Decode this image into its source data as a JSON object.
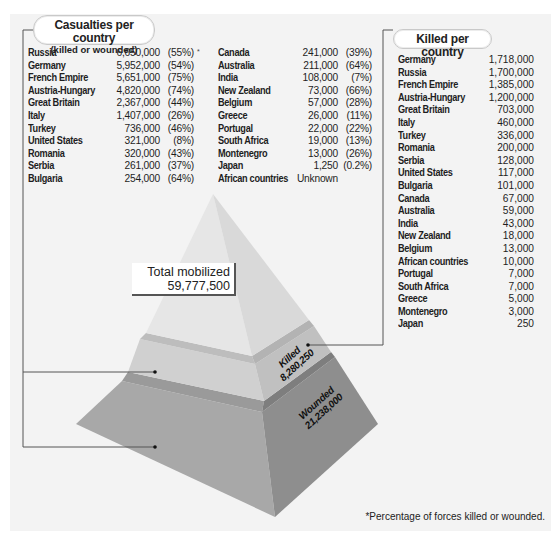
{
  "casualties": {
    "title": "Casualties per country",
    "subtitle": "(killed or wounded)",
    "asterisk": "*",
    "col1": [
      {
        "country": "Russia",
        "count": "6,650,000",
        "pct": "(55%)"
      },
      {
        "country": "Germany",
        "count": "5,952,000",
        "pct": "(54%)"
      },
      {
        "country": "French Empire",
        "count": "5,651,000",
        "pct": "(75%)"
      },
      {
        "country": "Austria-Hungary",
        "count": "4,820,000",
        "pct": "(74%)"
      },
      {
        "country": "Great Britain",
        "count": "2,367,000",
        "pct": "(44%)"
      },
      {
        "country": "Italy",
        "count": "1,407,000",
        "pct": "(26%)"
      },
      {
        "country": "Turkey",
        "count": "736,000",
        "pct": "(46%)"
      },
      {
        "country": "United States",
        "count": "321,000",
        "pct": "(8%)"
      },
      {
        "country": "Romania",
        "count": "320,000",
        "pct": "(43%)"
      },
      {
        "country": "Serbia",
        "count": "261,000",
        "pct": "(37%)"
      },
      {
        "country": "Bulgaria",
        "count": "254,000",
        "pct": "(64%)"
      }
    ],
    "col2": [
      {
        "country": "Canada",
        "count": "241,000",
        "pct": "(39%)"
      },
      {
        "country": "Australia",
        "count": "211,000",
        "pct": "(64%)"
      },
      {
        "country": "India",
        "count": "108,000",
        "pct": "(7%)"
      },
      {
        "country": "New Zealand",
        "count": "73,000",
        "pct": "(66%)"
      },
      {
        "country": "Belgium",
        "count": "57,000",
        "pct": "(28%)"
      },
      {
        "country": "Greece",
        "count": "26,000",
        "pct": "(11%)"
      },
      {
        "country": "Portugal",
        "count": "22,000",
        "pct": "(22%)"
      },
      {
        "country": "South Africa",
        "count": "19,000",
        "pct": "(13%)"
      },
      {
        "country": "Montenegro",
        "count": "13,000",
        "pct": "(26%)"
      },
      {
        "country": "Japan",
        "count": "1,250",
        "pct": "(0.2%)"
      },
      {
        "country": "African countries",
        "count": "Unknown",
        "pct": ""
      }
    ]
  },
  "killed": {
    "title": "Killed per country",
    "rows": [
      {
        "country": "Germany",
        "count": "1,718,000"
      },
      {
        "country": "Russia",
        "count": "1,700,000"
      },
      {
        "country": "French Empire",
        "count": "1,385,000"
      },
      {
        "country": "Austria-Hungary",
        "count": "1,200,000"
      },
      {
        "country": "Great Britain",
        "count": "703,000"
      },
      {
        "country": "Italy",
        "count": "460,000"
      },
      {
        "country": "Turkey",
        "count": "336,000"
      },
      {
        "country": "Romania",
        "count": "200,000"
      },
      {
        "country": "Serbia",
        "count": "128,000"
      },
      {
        "country": "United States",
        "count": "117,000"
      },
      {
        "country": "Bulgaria",
        "count": "101,000"
      },
      {
        "country": "Canada",
        "count": "67,000"
      },
      {
        "country": "Australia",
        "count": "59,000"
      },
      {
        "country": "India",
        "count": "43,000"
      },
      {
        "country": "New Zealand",
        "count": "18,000"
      },
      {
        "country": "Belgium",
        "count": "13,000"
      },
      {
        "country": "African countries",
        "count": "10,000"
      },
      {
        "country": "Portugal",
        "count": "7,000"
      },
      {
        "country": "South Africa",
        "count": "7,000"
      },
      {
        "country": "Greece",
        "count": "5,000"
      },
      {
        "country": "Montenegro",
        "count": "3,000"
      },
      {
        "country": "Japan",
        "count": "250"
      }
    ]
  },
  "pyramid": {
    "total_label": "Total mobilized",
    "total_value": "59,777,500",
    "killed_label": "Killed",
    "killed_value": "8,280,250",
    "wounded_label": "Wounded",
    "wounded_value": "21,238,000"
  },
  "footnote": "*Percentage of forces killed or wounded.",
  "colors": {
    "panel_bg": "#f3f3f3",
    "top_left_face": "#e6e6e6",
    "top_right_face": "#dadada",
    "killed_left_face": "#d2d2d2",
    "killed_right_face": "#c3c3c3",
    "wounded_left_face": "#a9a9a9",
    "wounded_right_face": "#8f8f8f",
    "leader_line": "#555555"
  }
}
